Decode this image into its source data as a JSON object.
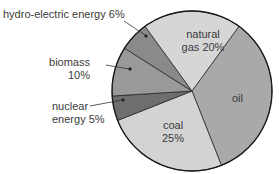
{
  "chart_data": {
    "type": "pie",
    "title": "",
    "start_angle_deg": 36,
    "direction": "clockwise",
    "slices": [
      {
        "label": "oil",
        "value": 34,
        "color": "#a9a9a9"
      },
      {
        "label": "coal",
        "value": 25,
        "color": "#d3d3d3"
      },
      {
        "label": "nuclear energy",
        "value": 5,
        "color": "#6e6e6e"
      },
      {
        "label": "biomass",
        "value": 10,
        "color": "#999999"
      },
      {
        "label": "hydro-electric energy",
        "value": 6,
        "color": "#8a8a8a"
      },
      {
        "label": "natural gas",
        "value": 20,
        "color": "#d6d6d6"
      }
    ]
  },
  "labels": {
    "hydro": "hydro-electric energy 6%",
    "natural_gas_1": "natural",
    "natural_gas_2": "gas 20%",
    "biomass_1": "biomass",
    "biomass_2": "10%",
    "oil": "oil",
    "nuclear_1": "nuclear",
    "nuclear_2": "energy 5%",
    "coal_1": "coal",
    "coal_2": "25%"
  }
}
